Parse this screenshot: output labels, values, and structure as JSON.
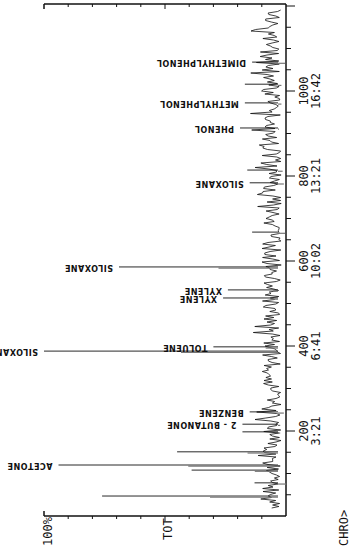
{
  "chart_data": {
    "type": "line",
    "title": "",
    "orientation": "rotated 90deg clockwise (time axis vertical, intensity horizontal, labels inverted)",
    "xlabel": "Scan / Retention time (min:sec)",
    "ylabel": "TOT",
    "y_max_label": "100%",
    "footer_label": "CHRO>",
    "xlim": [
      0,
      1205
    ],
    "ylim": [
      0,
      100
    ],
    "x_ticks": [
      {
        "scan": 200,
        "time": "3:21"
      },
      {
        "scan": 400,
        "time": "6:41"
      },
      {
        "scan": 600,
        "time": "10:02"
      },
      {
        "scan": 800,
        "time": "13:21"
      },
      {
        "scan": 1000,
        "time": "16:42"
      }
    ],
    "peaks": [
      {
        "scan": 47,
        "intensity": 76,
        "label": ""
      },
      {
        "scan": 78,
        "intensity": 13,
        "label": ""
      },
      {
        "scan": 108,
        "intensity": 39,
        "label": ""
      },
      {
        "scan": 120,
        "intensity": 94,
        "label": "ACETONE"
      },
      {
        "scan": 151,
        "intensity": 45,
        "label": ""
      },
      {
        "scan": 198,
        "intensity": 18,
        "label": ""
      },
      {
        "scan": 216,
        "intensity": 18,
        "label": "2 - BUTANONE"
      },
      {
        "scan": 245,
        "intensity": 15,
        "label": "BENZENE"
      },
      {
        "scan": 388,
        "intensity": 100,
        "label": "SILOXANE"
      },
      {
        "scan": 398,
        "intensity": 30,
        "label": "TOLUENE"
      },
      {
        "scan": 513,
        "intensity": 26,
        "label": "XYLENE"
      },
      {
        "scan": 532,
        "intensity": 24,
        "label": "XYLENE"
      },
      {
        "scan": 586,
        "intensity": 69,
        "label": "SILOXANE"
      },
      {
        "scan": 668,
        "intensity": 14,
        "label": ""
      },
      {
        "scan": 784,
        "intensity": 15,
        "label": "SILOXANE"
      },
      {
        "scan": 814,
        "intensity": 16,
        "label": ""
      },
      {
        "scan": 913,
        "intensity": 19,
        "label": "PHENOL"
      },
      {
        "scan": 972,
        "intensity": 17,
        "label": "METHYLPHENOL"
      },
      {
        "scan": 1016,
        "intensity": 17,
        "label": ""
      },
      {
        "scan": 1068,
        "intensity": 14,
        "label": "DIMETHYLPHENOL"
      }
    ],
    "baseline_noise_percent": [
      2,
      10
    ],
    "grid": false,
    "legend": null
  },
  "layout": {
    "baseline_x": 286,
    "full_scale_x": 44,
    "scan0_y": 516,
    "px_per_scan": 0.425,
    "top_y": 4,
    "line_color": "#111111"
  },
  "labels": {
    "y_max": "100%",
    "y_axis": "TOT",
    "footer": "CHRO>"
  }
}
